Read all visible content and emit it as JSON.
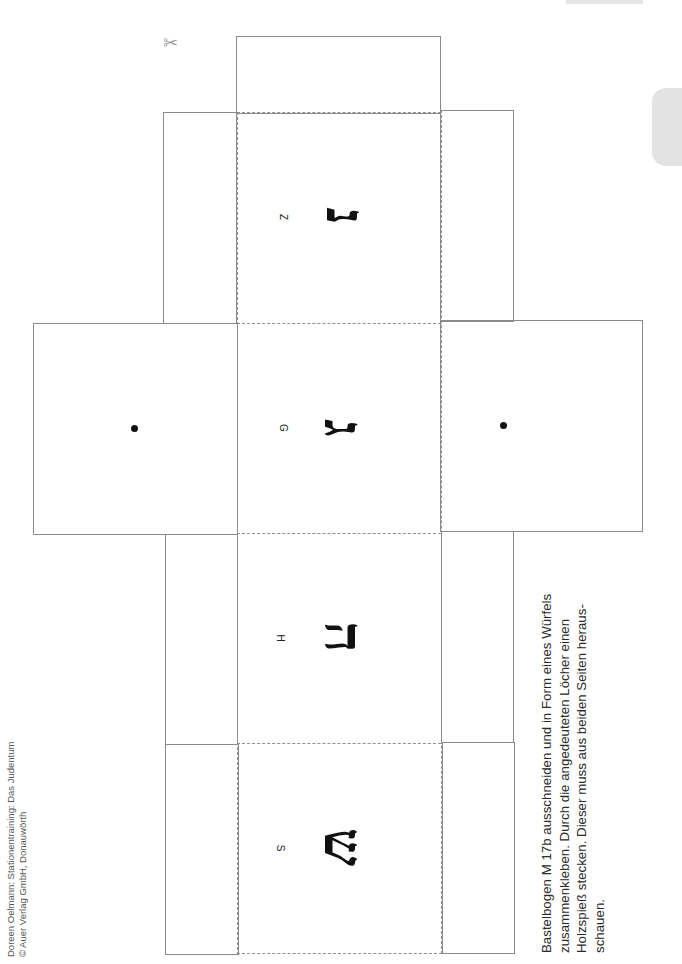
{
  "header": {
    "credits": [
      "Doreen Oelmann: Stationentraining: Das Judentum",
      "© Auer Verlag GmbH, Donauwörth"
    ]
  },
  "icons": {
    "scissors": "✂"
  },
  "cube_net": {
    "faces": [
      {
        "latin": "Z",
        "hebrew": "נ"
      },
      {
        "latin": "G",
        "hebrew": "ג"
      },
      {
        "latin": "H",
        "hebrew": "ה"
      },
      {
        "latin": "S",
        "hebrew": "ש"
      }
    ],
    "side_faces_marker": "hole-dot"
  },
  "instructions": {
    "lines": [
      "Bastelbogen M 17b ausschneiden und in Form eines Würfels",
      "zusammenkleben. Durch die angedeuteten Löcher einen",
      "Holzspieß stecken. Dieser muss aus beiden Seiten heraus-",
      "schauen."
    ]
  }
}
